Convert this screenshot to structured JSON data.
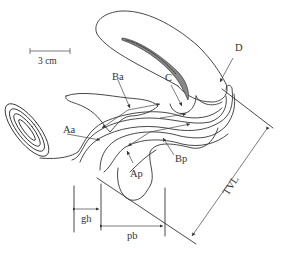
{
  "diagram": {
    "type": "anatomical sagittal schematic (POP-Q measurement points)",
    "scale_bar": {
      "label": "3 cm"
    },
    "labels": {
      "Aa": "Aa",
      "Ba": "Ba",
      "C": "C",
      "D": "D",
      "Ap": "Ap",
      "Bp": "Bp",
      "gh": "gh",
      "pb": "pb",
      "TVL": "TVL"
    },
    "colors": {
      "line": "#333333",
      "background": "#ffffff"
    }
  }
}
